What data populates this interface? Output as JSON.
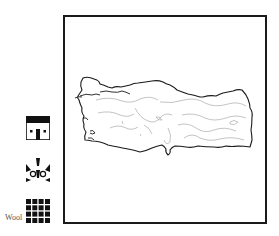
{
  "map": {
    "subject": "Turkey",
    "outline_color": "#1a1a1a",
    "contour_color": "#aaaaaa",
    "frame_color": "#1a1a1a"
  },
  "legend": {
    "items": [
      {
        "icon": "house-icon",
        "label": ""
      },
      {
        "icon": "rug-motif-icon",
        "label": ""
      },
      {
        "icon": "grid-weave-icon",
        "label": "Wool"
      }
    ]
  }
}
